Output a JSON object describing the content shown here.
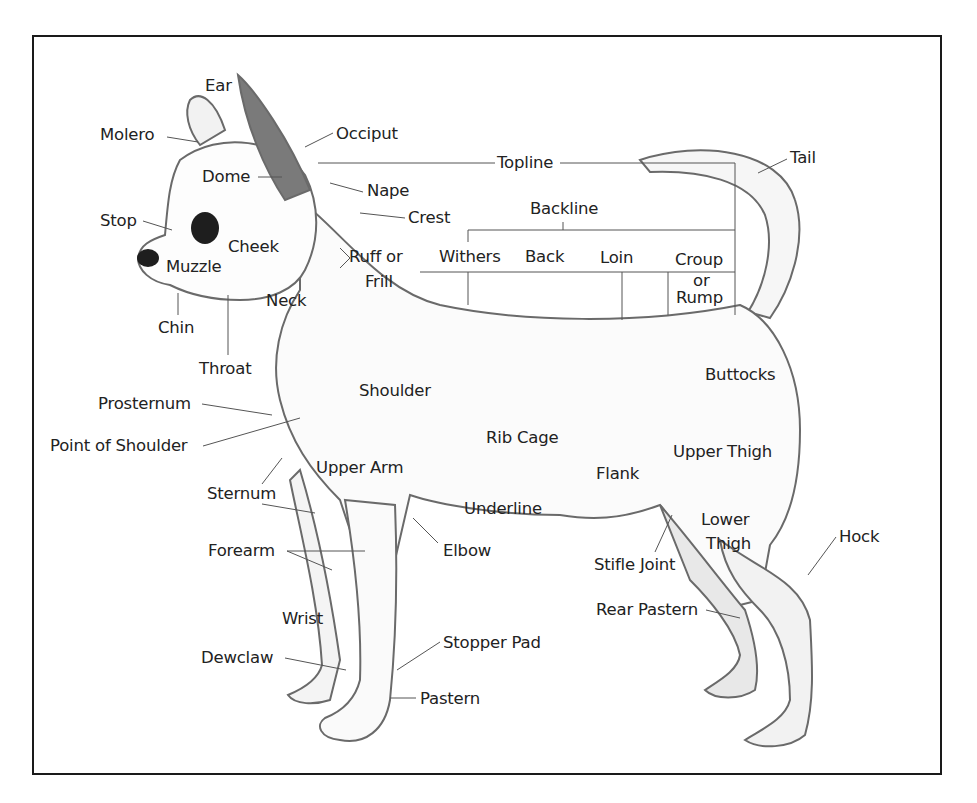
{
  "diagram": {
    "colors": {
      "ink": "#222222",
      "frame": "#1a1a1a",
      "leader": "#555555",
      "fur_shade": "#6a6a6a"
    },
    "labels": {
      "ear": "Ear",
      "molero": "Molero",
      "occiput": "Occiput",
      "topline": "Topline",
      "tail": "Tail",
      "dome": "Dome",
      "nape": "Nape",
      "crest": "Crest",
      "backline": "Backline",
      "stop": "Stop",
      "cheek": "Cheek",
      "muzzle": "Muzzle",
      "ruff_or": "Ruff or",
      "frill": "Frill",
      "withers": "Withers",
      "back": "Back",
      "loin": "Loin",
      "croup": "Croup",
      "or": "or",
      "rump": "Rump",
      "neck": "Neck",
      "chin": "Chin",
      "throat": "Throat",
      "shoulder": "Shoulder",
      "buttocks": "Buttocks",
      "prosternum": "Prosternum",
      "point_of_shoulder": "Point of Shoulder",
      "rib_cage": "Rib Cage",
      "upper_thigh": "Upper Thigh",
      "upper_arm": "Upper Arm",
      "flank": "Flank",
      "sternum": "Sternum",
      "underline": "Underline",
      "lower": "Lower",
      "thigh": "Thigh",
      "hock": "Hock",
      "forearm": "Forearm",
      "elbow": "Elbow",
      "stifle_joint": "Stifle Joint",
      "rear_pastern": "Rear Pastern",
      "wrist": "Wrist",
      "stopper_pad": "Stopper Pad",
      "dewclaw": "Dewclaw",
      "pastern": "Pastern"
    }
  }
}
